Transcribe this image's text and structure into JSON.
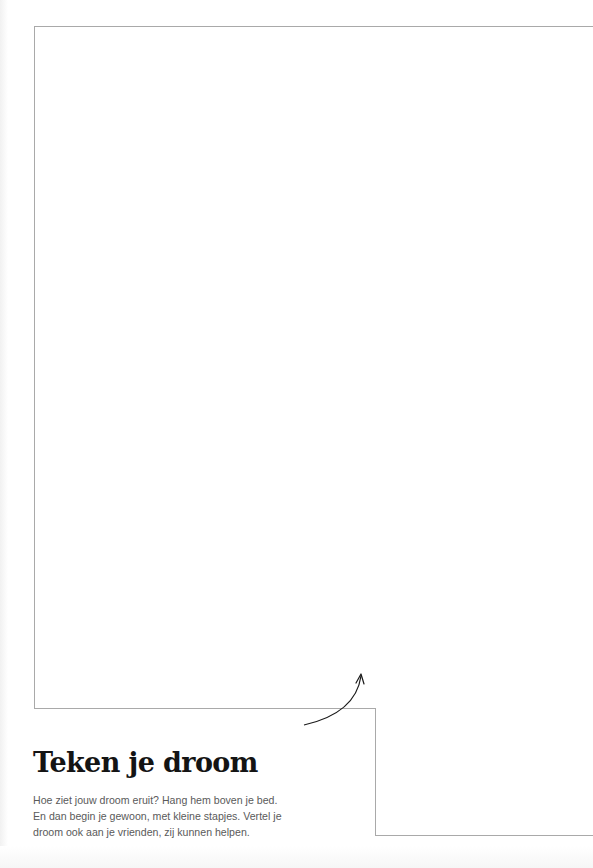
{
  "drawing_area": {
    "border_color": "#a9a9a9",
    "description": "blank frame for drawing"
  },
  "section": {
    "title": "Teken je droom",
    "body_lines": [
      "Hoe ziet jouw droom eruit? Hang hem boven je bed.",
      "En dan begin je gewoon, met kleine stapjes. Vertel je",
      "droom ook aan je vrienden, zij kunnen helpen."
    ]
  },
  "arrow": {
    "direction": "up-right",
    "color": "#1a1a1a"
  }
}
